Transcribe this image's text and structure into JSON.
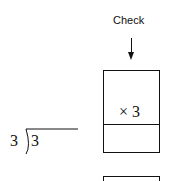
{
  "check": {
    "label": "Check",
    "multiplier": "× 3"
  },
  "division": {
    "divisor": "3",
    "dividend": "3"
  }
}
